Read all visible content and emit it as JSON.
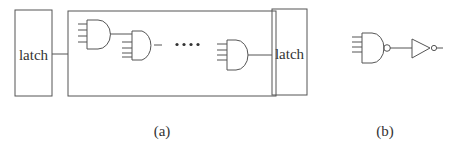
{
  "figure": {
    "panel_a": {
      "caption": "(a)",
      "left_latch_label": "latch",
      "right_latch_label": "latch",
      "ellipsis": "• • • •",
      "gates": [
        "and-gate",
        "and-gate",
        "and-gate"
      ]
    },
    "panel_b": {
      "caption": "(b)",
      "gates": [
        "nand-gate",
        "inverter"
      ]
    },
    "colors": {
      "stroke": "#555555",
      "background": "#ffffff"
    }
  }
}
